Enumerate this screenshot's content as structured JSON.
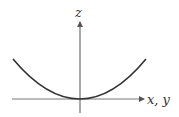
{
  "diagram": {
    "axes": {
      "vertical_label": "z",
      "horizontal_label": "x, y"
    },
    "curve": {
      "type": "parabola",
      "description": "upward-opening parabola with vertex at origin"
    },
    "colors": {
      "curve": "#333333",
      "axes": "#555555",
      "background": "#ffffff"
    }
  }
}
